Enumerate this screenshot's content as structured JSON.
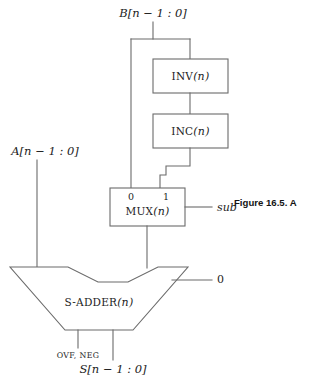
{
  "figure": {
    "caption": "Figure 16.5. A",
    "stroke_color": "#6b6b6b",
    "text_color": "#1d1d1d"
  },
  "signals": {
    "input_b": "B[n − 1 : 0]",
    "input_a": "A[n − 1 : 0]",
    "output_s": "S[n − 1 : 0]",
    "flags": "OVF, NEG",
    "control_sub": "sub",
    "carry_in": "0"
  },
  "blocks": [
    {
      "id": "inv",
      "name": "INV",
      "arg": "(n)"
    },
    {
      "id": "inc",
      "name": "INC",
      "arg": "(n)"
    },
    {
      "id": "mux",
      "name": "MUX",
      "arg": "(n)"
    },
    {
      "id": "adder",
      "name": "S-ADDER",
      "arg": "(n)"
    }
  ],
  "mux": {
    "select_labels": [
      "0",
      "1"
    ]
  },
  "diagram_data": {
    "type": "block-diagram",
    "description": "Adder/subtractor datapath: B is routed both directly and through INV then INC into a 2-to-1 multiplexer controlled by sub; the MUX output and A feed an S-ADDER with carry-in 0, producing S and the OVF, NEG flags.",
    "nodes": [
      "B[n − 1 : 0]",
      "INV(n)",
      "INC(n)",
      "MUX(n)",
      "A[n − 1 : 0]",
      "S-ADDER(n)",
      "S[n − 1 : 0]",
      "OVF, NEG",
      "sub",
      "0"
    ],
    "edges": [
      {
        "from": "B[n − 1 : 0]",
        "to": "MUX(n)",
        "port": "0"
      },
      {
        "from": "B[n − 1 : 0]",
        "to": "INV(n)"
      },
      {
        "from": "INV(n)",
        "to": "INC(n)"
      },
      {
        "from": "INC(n)",
        "to": "MUX(n)",
        "port": "1"
      },
      {
        "from": "sub",
        "to": "MUX(n)",
        "port": "select"
      },
      {
        "from": "MUX(n)",
        "to": "S-ADDER(n)"
      },
      {
        "from": "A[n − 1 : 0]",
        "to": "S-ADDER(n)"
      },
      {
        "from": "0",
        "to": "S-ADDER(n)",
        "port": "carry-in"
      },
      {
        "from": "S-ADDER(n)",
        "to": "S[n − 1 : 0]"
      },
      {
        "from": "S-ADDER(n)",
        "to": "OVF, NEG"
      }
    ]
  }
}
